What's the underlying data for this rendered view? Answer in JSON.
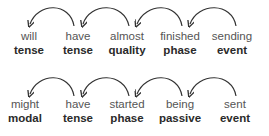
{
  "rows": [
    {
      "tokens": [
        {
          "word": "will",
          "label": "tense",
          "x": 29
        },
        {
          "word": "have",
          "label": "tense",
          "x": 78
        },
        {
          "word": "almost",
          "label": "quality",
          "x": 127
        },
        {
          "word": "finished",
          "label": "phase",
          "x": 178
        },
        {
          "word": "sending",
          "label": "event",
          "x": 226
        }
      ],
      "arcs": [
        {
          "from": "have",
          "to": "will"
        },
        {
          "from": "almost",
          "to": "have"
        },
        {
          "from": "finished",
          "to": "almost"
        },
        {
          "from": "sending",
          "to": "finished"
        }
      ]
    },
    {
      "tokens": [
        {
          "word": "might",
          "label": "modal",
          "x": 22
        },
        {
          "word": "have",
          "label": "tense",
          "x": 78
        },
        {
          "word": "started",
          "label": "phase",
          "x": 127
        },
        {
          "word": "being",
          "label": "passive",
          "x": 178
        },
        {
          "word": "sent",
          "label": "event",
          "x": 230
        }
      ],
      "arcs": [
        {
          "from": "have",
          "to": "might"
        },
        {
          "from": "started",
          "to": "have"
        },
        {
          "from": "being",
          "to": "started"
        },
        {
          "from": "sent",
          "to": "being"
        }
      ]
    }
  ],
  "colors": {
    "arc": "#333333",
    "word": "#555555",
    "label": "#2a2a2a"
  }
}
